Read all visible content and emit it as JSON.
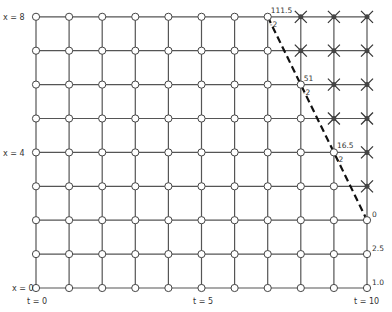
{
  "diagram": {
    "type": "finite-difference grid",
    "grid": {
      "t_min": 0,
      "t_max": 10,
      "x_min": 0,
      "x_max": 8,
      "origin_px": [
        36,
        288
      ],
      "dt_px": 33.1,
      "dx_px": 33.9,
      "line_color": "#555555",
      "node_fill": "#ffffff"
    },
    "axis_labels": {
      "x_top": "x = 8",
      "x_mid": "x = 4",
      "x_bottom": "x = 0",
      "t_start": "t = 0",
      "t_mid": "t = 5",
      "t_end": "t = 10"
    },
    "excluded_nodes": [
      [
        8,
        8
      ],
      [
        8,
        7
      ],
      [
        9,
        8
      ],
      [
        9,
        7
      ],
      [
        9,
        6
      ],
      [
        9,
        5
      ],
      [
        10,
        8
      ],
      [
        10,
        7
      ],
      [
        10,
        6
      ],
      [
        10,
        5
      ],
      [
        10,
        4
      ],
      [
        10,
        3
      ]
    ],
    "boundary_line": {
      "style": "dashed",
      "color": "#111111",
      "points": [
        [
          7,
          8
        ],
        [
          8,
          6
        ],
        [
          9,
          4
        ],
        [
          10,
          2
        ]
      ]
    },
    "node_values": [
      {
        "t": 7,
        "x": 8,
        "value": "111.5",
        "slope": "-2"
      },
      {
        "t": 8,
        "x": 6,
        "value": "51",
        "slope": "-2"
      },
      {
        "t": 9,
        "x": 4,
        "value": "16.5",
        "slope": "-2"
      },
      {
        "t": 10,
        "x": 2,
        "value": "0"
      },
      {
        "t": 10,
        "x": 1,
        "value": "2.5"
      },
      {
        "t": 10,
        "x": 0,
        "value": "1.0"
      }
    ]
  }
}
